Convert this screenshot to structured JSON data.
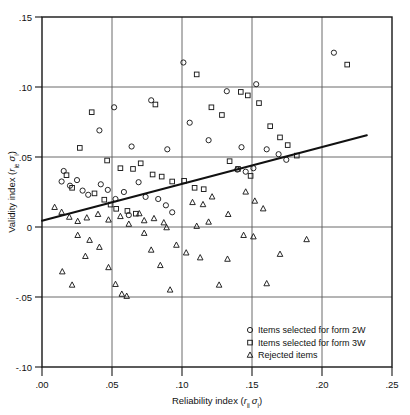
{
  "chart_data": {
    "type": "scatter",
    "title": "",
    "xlabel": "Reliability index (r_ii σ_i)",
    "ylabel": "Validity index (r_ie σ_i)",
    "xlabel_parts": {
      "prefix": "Reliability index (",
      "italic1": "r",
      "sub1": "ii",
      "italic2": "σ",
      "sub2": "i",
      "suffix": ")"
    },
    "ylabel_parts": {
      "prefix": "Validity index (",
      "italic1": "r",
      "sub1": "ie",
      "italic2": "σ",
      "sub2": "i",
      "suffix": ")"
    },
    "xlim": [
      0.0,
      0.25
    ],
    "ylim": [
      -0.1,
      0.15
    ],
    "xticks": [
      0.0,
      0.05,
      0.1,
      0.15,
      0.2,
      0.25
    ],
    "xtick_labels": [
      ".00",
      ".05",
      ".10",
      ".15",
      ".20",
      ".25"
    ],
    "yticks": [
      -0.1,
      -0.05,
      0.0,
      0.05,
      0.1,
      0.15
    ],
    "ytick_labels": [
      "-.10",
      "-.05",
      "0",
      ".05",
      ".10",
      ".15"
    ],
    "grid": true,
    "grid_x": [
      0.05,
      0.1,
      0.15,
      0.2
    ],
    "grid_y": [
      -0.05,
      0.0,
      0.05,
      0.1
    ],
    "legend_position": "bottom-right",
    "trendline": {
      "x": [
        0.0,
        0.232
      ],
      "y": [
        0.0045,
        0.0655
      ],
      "label": ""
    },
    "series": [
      {
        "name": "Items selected for form 2W",
        "marker": "circle",
        "points": [
          [
            0.041,
            0.069
          ],
          [
            0.0515,
            0.0855
          ],
          [
            0.064,
            0.0575
          ],
          [
            0.078,
            0.0905
          ],
          [
            0.0895,
            0.0555
          ],
          [
            0.101,
            0.1175
          ],
          [
            0.1055,
            0.0745
          ],
          [
            0.119,
            0.062
          ],
          [
            0.132,
            0.097
          ],
          [
            0.1425,
            0.057
          ],
          [
            0.153,
            0.102
          ],
          [
            0.1605,
            0.0555
          ],
          [
            0.169,
            0.052
          ],
          [
            0.1745,
            0.048
          ],
          [
            0.2085,
            0.1245
          ],
          [
            0.0155,
            0.04
          ],
          [
            0.014,
            0.0325
          ],
          [
            0.02,
            0.0295
          ],
          [
            0.025,
            0.0335
          ],
          [
            0.029,
            0.026
          ],
          [
            0.033,
            0.023
          ],
          [
            0.042,
            0.0305
          ],
          [
            0.047,
            0.0265
          ],
          [
            0.0525,
            0.02
          ],
          [
            0.0585,
            0.025
          ],
          [
            0.069,
            0.032
          ],
          [
            0.074,
            0.0215
          ],
          [
            0.083,
            0.02
          ],
          [
            0.0885,
            0.0155
          ],
          [
            0.093,
            0.0105
          ],
          [
            0.062,
            0.0085
          ],
          [
            0.1395,
            0.041
          ],
          [
            0.1455,
            0.0395
          ],
          [
            0.151,
            0.042
          ]
        ]
      },
      {
        "name": "Items selected for form 3W",
        "marker": "square",
        "points": [
          [
            0.0355,
            0.082
          ],
          [
            0.081,
            0.0875
          ],
          [
            0.1105,
            0.109
          ],
          [
            0.121,
            0.0855
          ],
          [
            0.1285,
            0.08
          ],
          [
            0.142,
            0.0965
          ],
          [
            0.147,
            0.094
          ],
          [
            0.155,
            0.0885
          ],
          [
            0.163,
            0.072
          ],
          [
            0.17,
            0.064
          ],
          [
            0.1755,
            0.0585
          ],
          [
            0.182,
            0.051
          ],
          [
            0.218,
            0.116
          ],
          [
            0.027,
            0.0565
          ],
          [
            0.0465,
            0.0475
          ],
          [
            0.056,
            0.042
          ],
          [
            0.065,
            0.0415
          ],
          [
            0.0705,
            0.0455
          ],
          [
            0.079,
            0.0375
          ],
          [
            0.0855,
            0.036
          ],
          [
            0.093,
            0.0325
          ],
          [
            0.1015,
            0.033
          ],
          [
            0.109,
            0.028
          ],
          [
            0.1155,
            0.027
          ],
          [
            0.0175,
            0.037
          ],
          [
            0.0215,
            0.028
          ],
          [
            0.0375,
            0.024
          ],
          [
            0.0445,
            0.0195
          ],
          [
            0.049,
            0.016
          ],
          [
            0.053,
            0.013
          ],
          [
            0.061,
            0.0115
          ],
          [
            0.067,
            0.0095
          ],
          [
            0.134,
            0.047
          ],
          [
            0.14,
            0.0415
          ],
          [
            0.149,
            0.0365
          ]
        ]
      },
      {
        "name": "Rejected items",
        "marker": "triangle",
        "points": [
          [
            0.009,
            0.014
          ],
          [
            0.014,
            0.0105
          ],
          [
            0.0195,
            0.007
          ],
          [
            0.0255,
            0.004
          ],
          [
            0.032,
            0.0065
          ],
          [
            0.04,
            0.009
          ],
          [
            0.0475,
            0.005
          ],
          [
            0.056,
            0.0075
          ],
          [
            0.062,
            0.002
          ],
          [
            0.0695,
            0.0095
          ],
          [
            0.073,
            0.0045
          ],
          [
            0.08,
            0.006
          ],
          [
            0.087,
            0.003
          ],
          [
            0.0255,
            -0.006
          ],
          [
            0.034,
            -0.0095
          ],
          [
            0.041,
            -0.0145
          ],
          [
            0.031,
            -0.021
          ],
          [
            0.0475,
            -0.029
          ],
          [
            0.0525,
            -0.041
          ],
          [
            0.0145,
            -0.032
          ],
          [
            0.0215,
            -0.0415
          ],
          [
            0.073,
            -0.0045
          ],
          [
            0.078,
            -0.0165
          ],
          [
            0.0845,
            -0.0275
          ],
          [
            0.0915,
            -0.045
          ],
          [
            0.089,
            -0.0005
          ],
          [
            0.096,
            -0.013
          ],
          [
            0.103,
            -0.0185
          ],
          [
            0.1075,
            0.0175
          ],
          [
            0.115,
            0.016
          ],
          [
            0.1215,
            0.0215
          ],
          [
            0.133,
            0.009
          ],
          [
            0.1455,
            0.025
          ],
          [
            0.152,
            0.0185
          ],
          [
            0.158,
            0.013
          ],
          [
            0.144,
            -0.006
          ],
          [
            0.151,
            -0.007
          ],
          [
            0.17,
            -0.0195
          ],
          [
            0.1605,
            -0.0405
          ],
          [
            0.1265,
            -0.0415
          ],
          [
            0.113,
            -0.022
          ],
          [
            0.1325,
            -0.023
          ],
          [
            0.189,
            -0.009
          ],
          [
            0.119,
            0.0035
          ],
          [
            0.0605,
            -0.0495
          ],
          [
            0.057,
            -0.048
          ],
          [
            0.1105,
            0.0005
          ]
        ]
      }
    ]
  },
  "legend": {
    "items": [
      {
        "label": "Items selected for form 2W",
        "marker": "circle"
      },
      {
        "label": "Items selected for form 3W",
        "marker": "square"
      },
      {
        "label": "Rejected items",
        "marker": "triangle"
      }
    ]
  }
}
